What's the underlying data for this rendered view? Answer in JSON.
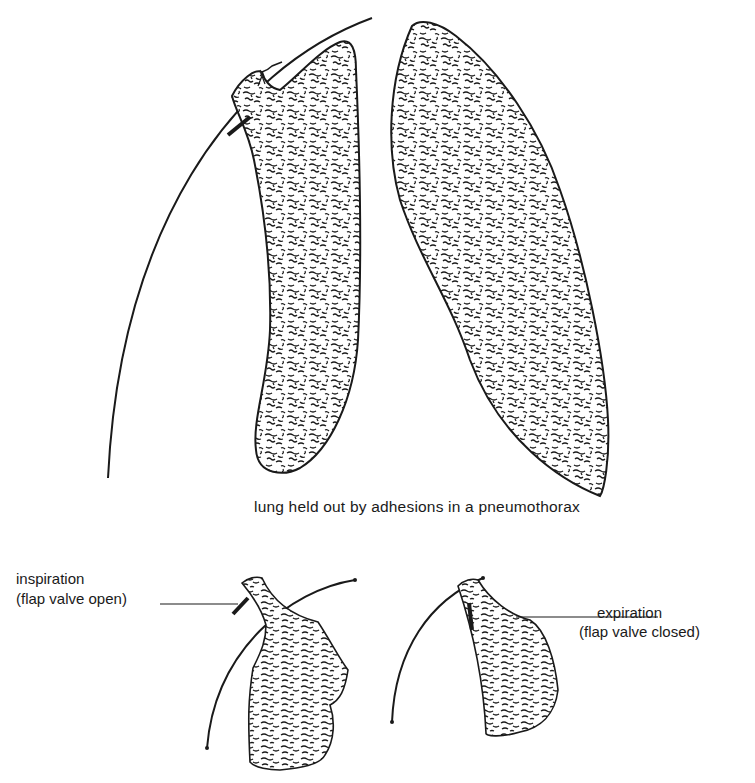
{
  "figure": {
    "main": {
      "caption": "lung held out by adhesions in a pneumothorax",
      "parts": [
        "chest-wall-arc",
        "collapsed-lung-with-adhesion",
        "contralateral-lung"
      ]
    },
    "insets": [
      {
        "id": "inspiration",
        "label": "inspiration",
        "sublabel": "(flap valve open)"
      },
      {
        "id": "expiration",
        "label": "expiration",
        "sublabel": "(flap valve closed)"
      }
    ],
    "colors": {
      "ink": "#1a1a1a",
      "background": "#ffffff"
    }
  }
}
